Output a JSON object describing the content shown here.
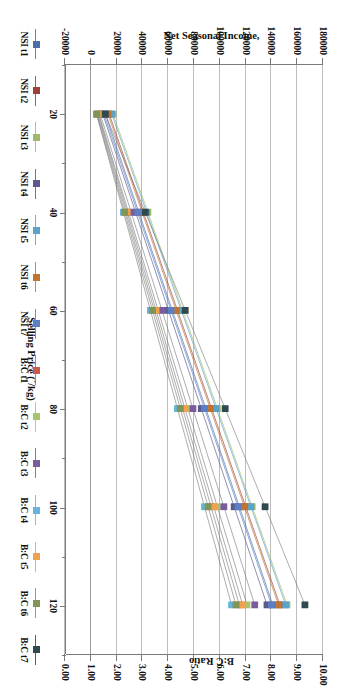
{
  "chart_data": {
    "type": "line",
    "title": "",
    "xlabel": "Selling Price (`/kg)",
    "ylabel": "Net Seasonal Income,",
    "y2label": "B:C Ratio",
    "x": [
      20,
      40,
      60,
      80,
      100,
      120
    ],
    "xlim": [
      10,
      130
    ],
    "xticks": [
      20,
      40,
      60,
      80,
      100,
      120
    ],
    "ylim": [
      -20000,
      180000
    ],
    "yticks": [
      -20000,
      0,
      20000,
      40000,
      60000,
      80000,
      100000,
      120000,
      140000,
      160000,
      180000
    ],
    "ytick_labels": [
      "-20000",
      "0",
      "20000",
      "40000",
      "60000",
      "80000",
      "100000",
      "120000",
      "140000",
      "160000",
      "180000"
    ],
    "y2lim": [
      0,
      10
    ],
    "y2ticks": [
      0,
      1,
      2,
      3,
      4,
      5,
      6,
      7,
      8,
      9,
      10
    ],
    "y2tick_labels": [
      "0.00",
      "1.00",
      "2.00",
      "3.00",
      "4.00",
      "5.00",
      "6.00",
      "7.00",
      "8.00",
      "9.00",
      "10.00"
    ],
    "grid": "horizontal",
    "legend_position": "bottom",
    "series": [
      {
        "name": "NSI t1",
        "axis": "primary",
        "color": "#4a6ea8",
        "values": [
          11000,
          37000,
          63000,
          89000,
          115000,
          141000
        ]
      },
      {
        "name": "NSI t2",
        "axis": "primary",
        "color": "#9e4038",
        "values": [
          14000,
          40500,
          67000,
          93500,
          120000,
          146500
        ]
      },
      {
        "name": "NSI t3",
        "axis": "primary",
        "color": "#9cba6a",
        "values": [
          17000,
          44000,
          71000,
          98000,
          125000,
          152000
        ]
      },
      {
        "name": "NSI t4",
        "axis": "primary",
        "color": "#5a5a8c",
        "values": [
          9000,
          34500,
          60000,
          85500,
          111000,
          136500
        ]
      },
      {
        "name": "NSI t5",
        "axis": "primary",
        "color": "#5ba3c7",
        "values": [
          16000,
          43000,
          70000,
          97000,
          124000,
          151000
        ]
      },
      {
        "name": "NSI t6",
        "axis": "primary",
        "color": "#c1742f",
        "values": [
          13000,
          39500,
          66000,
          92500,
          119000,
          145500
        ]
      },
      {
        "name": "NSI t7",
        "axis": "primary",
        "color": "#5b7fc4",
        "values": [
          10000,
          36000,
          62000,
          88000,
          114000,
          140000
        ]
      },
      {
        "name": "B:C t1",
        "axis": "secondary",
        "color": "#c95b4e",
        "values": [
          1.25,
          2.35,
          3.45,
          4.55,
          5.65,
          6.75
        ]
      },
      {
        "name": "B:C t2",
        "axis": "secondary",
        "color": "#a8c46e",
        "values": [
          1.3,
          2.45,
          3.6,
          4.75,
          5.9,
          7.05
        ]
      },
      {
        "name": "B:C t3",
        "axis": "secondary",
        "color": "#7a5b9e",
        "values": [
          1.35,
          2.55,
          3.75,
          4.95,
          6.15,
          7.35
        ]
      },
      {
        "name": "B:C t4",
        "axis": "secondary",
        "color": "#64b4dc",
        "values": [
          1.2,
          2.25,
          3.3,
          4.35,
          5.4,
          6.45
        ]
      },
      {
        "name": "B:C t5",
        "axis": "secondary",
        "color": "#efa050",
        "values": [
          1.28,
          2.4,
          3.52,
          4.64,
          5.76,
          6.88
        ]
      },
      {
        "name": "B:C t6",
        "axis": "secondary",
        "color": "#7f9455",
        "values": [
          1.22,
          2.3,
          3.38,
          4.46,
          5.54,
          6.62
        ]
      },
      {
        "name": "B:C t7",
        "axis": "secondary",
        "color": "#2e4a4f",
        "values": [
          1.55,
          3.1,
          4.65,
          6.2,
          7.75,
          9.3
        ]
      }
    ]
  },
  "legend": {
    "items": [
      {
        "label": "NSI t1"
      },
      {
        "label": "NSI t2"
      },
      {
        "label": "NSI t3"
      },
      {
        "label": "NSI t4"
      },
      {
        "label": "NSI t5"
      },
      {
        "label": "NSI t6"
      },
      {
        "label": "NSI t7"
      },
      {
        "label": "B:C t1"
      },
      {
        "label": "B:C t2"
      },
      {
        "label": "B:C t3"
      },
      {
        "label": "B:C t4"
      },
      {
        "label": "B:C t5"
      },
      {
        "label": "B:C t6"
      },
      {
        "label": "B:C t7"
      }
    ]
  }
}
